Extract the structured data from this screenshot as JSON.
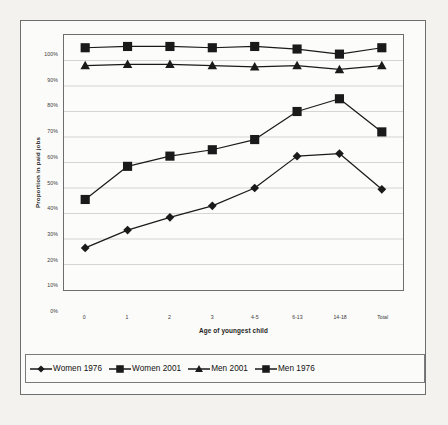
{
  "chart_data": {
    "type": "line",
    "title": "",
    "xlabel": "Age of youngest child",
    "ylabel": "Proportion in paid jobs",
    "categories": [
      "0",
      "1",
      "2",
      "3",
      "4-5",
      "6-13",
      "14-18",
      "Total"
    ],
    "ylim": [
      0,
      100
    ],
    "ytick_labels": [
      "100%",
      "90%",
      "80%",
      "70%",
      "60%",
      "50%",
      "40%",
      "30%",
      "20%",
      "10%",
      "0%"
    ],
    "ytick_values": [
      100,
      90,
      80,
      70,
      60,
      50,
      40,
      30,
      20,
      10,
      0
    ],
    "grid": true,
    "legend_position": "bottom",
    "series": [
      {
        "name": "Women 1976",
        "marker": "diamond",
        "values": [
          16.5,
          23.5,
          28.5,
          33,
          40,
          52.5,
          53.5,
          39.5
        ]
      },
      {
        "name": "Women 2001",
        "marker": "square",
        "values": [
          35.5,
          48.5,
          52.5,
          55,
          59,
          70,
          75,
          62
        ]
      },
      {
        "name": "Men 2001",
        "marker": "triangle",
        "values": [
          88,
          88.5,
          88.5,
          88,
          87.5,
          88,
          86.5,
          88
        ]
      },
      {
        "name": "Men 1976",
        "marker": "square",
        "values": [
          95,
          95.5,
          95.5,
          95,
          95.5,
          94.5,
          92.5,
          95
        ]
      }
    ]
  },
  "legend": {
    "entries": [
      {
        "label": "Women 1976",
        "marker": "diamond"
      },
      {
        "label": "Women 2001",
        "marker": "square"
      },
      {
        "label": "Men 2001",
        "marker": "triangle"
      },
      {
        "label": "Men 1976",
        "marker": "square"
      }
    ]
  },
  "colors": {
    "series_line": "#1a1a1a",
    "grid": "#d0d0cc",
    "axis": "#6d6d6d",
    "frame": "#6e6e6e",
    "plot_bg": "#fcfcfa",
    "page_bg": "#f3f2ef"
  }
}
